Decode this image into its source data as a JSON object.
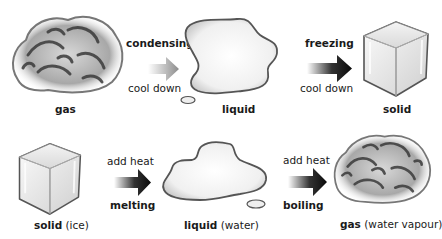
{
  "diagram": {
    "top_row": {
      "states": [
        {
          "label_bold": "gas",
          "label_extra": "",
          "icon": "gas-cloud"
        },
        {
          "label_bold": "liquid",
          "label_extra": "",
          "icon": "liquid-puddle"
        },
        {
          "label_bold": "solid",
          "label_extra": "",
          "icon": "ice-cube"
        }
      ],
      "transitions": [
        {
          "process": "condensing",
          "condition": "cool down",
          "arrow_style": "gray"
        },
        {
          "process": "freezing",
          "condition": "cool down",
          "arrow_style": "black"
        }
      ]
    },
    "bottom_row": {
      "states": [
        {
          "label_bold": "solid",
          "label_extra": " (ice)",
          "icon": "ice-cube"
        },
        {
          "label_bold": "liquid",
          "label_extra": " (water)",
          "icon": "liquid-puddle"
        },
        {
          "label_bold": "gas",
          "label_extra": " (water vapour)",
          "icon": "gas-cloud"
        }
      ],
      "transitions": [
        {
          "condition": "add heat",
          "process": "melting",
          "arrow_style": "black"
        },
        {
          "condition": "add heat",
          "process": "boiling",
          "arrow_style": "black"
        }
      ]
    },
    "colors": {
      "text": "#1a1a1a",
      "arrow_dark": "#111111",
      "arrow_gray": "#8a8a8a",
      "background": "#ffffff"
    }
  }
}
